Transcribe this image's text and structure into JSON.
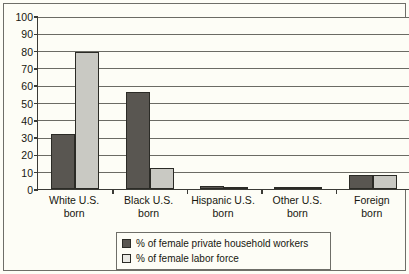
{
  "chart_data": {
    "type": "bar",
    "title": "",
    "subtitle": "",
    "xlabel": "",
    "ylabel": "",
    "ylim": [
      0,
      100
    ],
    "yticks": [
      0,
      10,
      20,
      30,
      40,
      50,
      60,
      70,
      80,
      90,
      100
    ],
    "ytick_labels": [
      "0",
      "10",
      "20",
      "30",
      "40",
      "50",
      "60",
      "70",
      "80",
      "90",
      "100"
    ],
    "grid": "horizontal",
    "legend_position": "bottom-center",
    "categories": [
      "White U.S.\nborn",
      "Black U.S.\nborn",
      "Hispanic U.S.\nborn",
      "Other U.S.\nborn",
      "Foreign\nborn"
    ],
    "series": [
      {
        "name": "% of female private household workers",
        "color": "#595651",
        "values": [
          32,
          56,
          1.5,
          0.5,
          8
        ]
      },
      {
        "name": "% of female labor force",
        "color": "#c9c9c3",
        "values": [
          79,
          12,
          1,
          0.5,
          8
        ]
      }
    ]
  },
  "legend": {
    "items": [
      {
        "label": "% of female private household workers",
        "swatch": "dark-gray-swatch"
      },
      {
        "label": "% of female labor force",
        "swatch": "light-gray-swatch"
      }
    ]
  }
}
